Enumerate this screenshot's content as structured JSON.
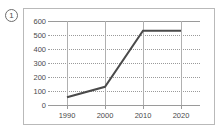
{
  "figure": {
    "number": "1",
    "badge_name": "figure-number-badge"
  },
  "chart_data": {
    "type": "line",
    "title": "",
    "xlabel": "",
    "ylabel": "",
    "categories": [
      "1990",
      "2000",
      "2010",
      "2020"
    ],
    "x": [
      1990,
      2000,
      2010,
      2020
    ],
    "values": [
      55,
      130,
      530,
      530
    ],
    "series": [
      {
        "name": "series-1",
        "values": [
          55,
          130,
          530,
          530
        ],
        "color": "#4a4a4a"
      }
    ],
    "ylim": [
      0,
      600
    ],
    "yticks": [
      0,
      100,
      200,
      300,
      400,
      500,
      600
    ],
    "ytick_labels": [
      "0",
      "100",
      "200",
      "300",
      "400",
      "500",
      "600"
    ],
    "xtick_labels": [
      "1990",
      "2000",
      "2010",
      "2020"
    ],
    "xlim": [
      1985,
      2025
    ],
    "grid": true,
    "grid_horizontal_style": "dotted",
    "grid_vertical_style": "solid",
    "legend": false,
    "legend_position": "none",
    "markers": false
  },
  "colors": {
    "line": "#4a4a4a",
    "grid": "#9a9a9a",
    "grid_vertical": "#b0b0b0",
    "frame_border": "#b9b9b9",
    "text": "#4a4a4a",
    "background": "#ffffff"
  }
}
